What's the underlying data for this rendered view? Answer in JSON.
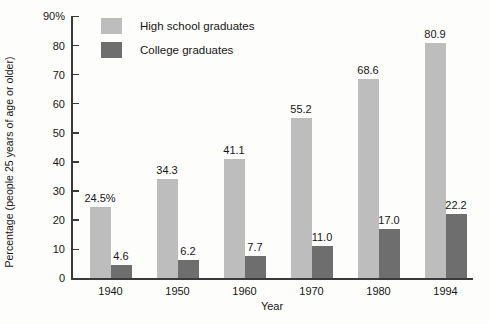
{
  "chart_data": {
    "type": "bar",
    "title": "",
    "xlabel": "Year",
    "ylabel": "Percentage (people 25 years of age or older)",
    "categories": [
      "1940",
      "1950",
      "1960",
      "1970",
      "1980",
      "1994"
    ],
    "series": [
      {
        "name": "High school graduates",
        "color": "#bdbdbd",
        "values": [
          24.5,
          34.3,
          41.1,
          55.2,
          68.6,
          80.9
        ],
        "labels": [
          "24.5%",
          "34.3",
          "41.1",
          "55.2",
          "68.6",
          "80.9"
        ]
      },
      {
        "name": "College graduates",
        "color": "#6e6e6e",
        "values": [
          4.6,
          6.2,
          7.7,
          11.0,
          17.0,
          22.2
        ],
        "labels": [
          "4.6",
          "6.2",
          "7.7",
          "11.0",
          "17.0",
          "22.2"
        ]
      }
    ],
    "ylim": [
      0,
      90
    ],
    "yticks": [
      0,
      10,
      20,
      30,
      40,
      50,
      60,
      70,
      80,
      90
    ],
    "ytick_labels": [
      "0",
      "10",
      "20",
      "30",
      "40",
      "50",
      "60",
      "70",
      "80",
      "90%"
    ],
    "grid": false,
    "legend_position": "top-left-inside"
  },
  "legend": {
    "items": [
      {
        "label": "High school graduates"
      },
      {
        "label": "College graduates"
      }
    ]
  }
}
